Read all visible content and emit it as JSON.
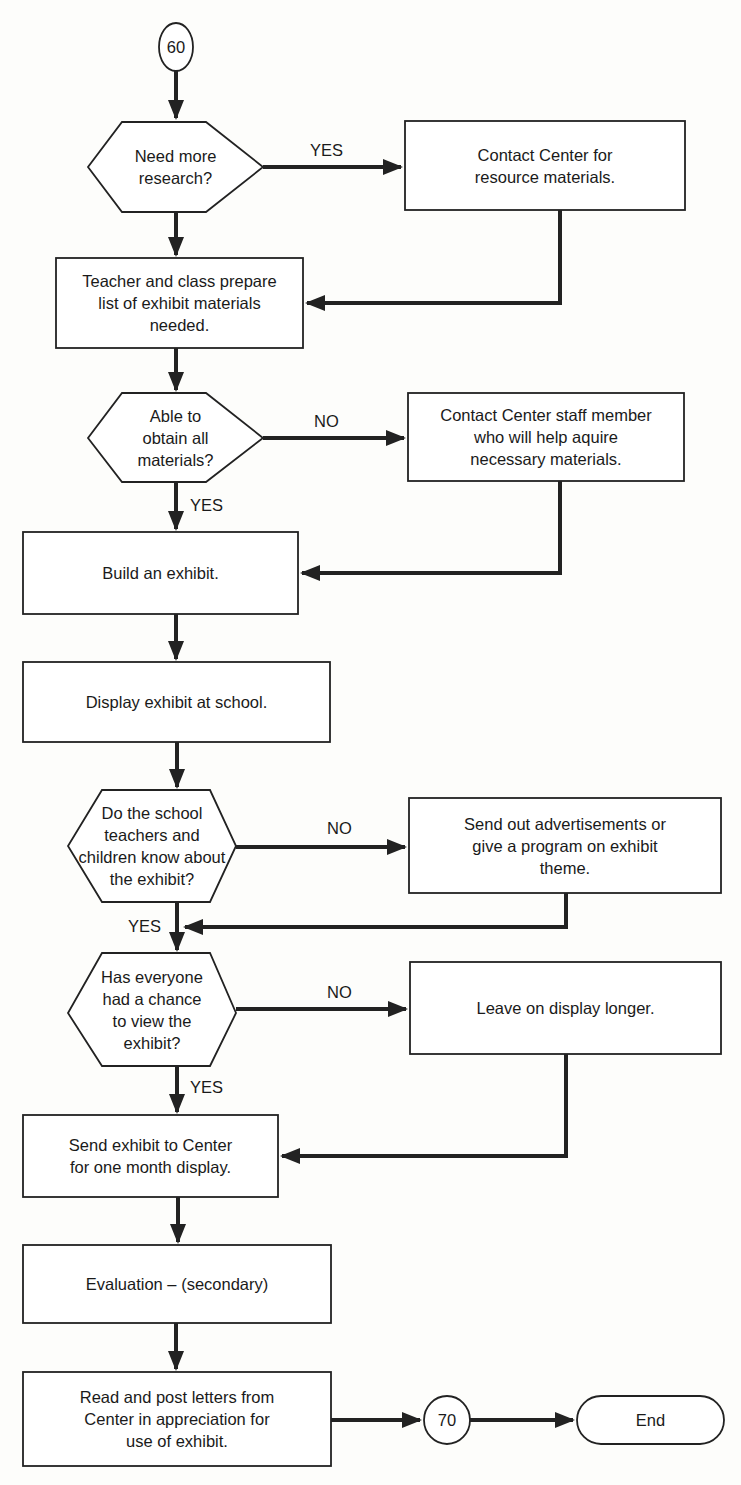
{
  "diagram": {
    "type": "flowchart",
    "nodes": {
      "c60": {
        "shape": "connector",
        "label": "60"
      },
      "d1": {
        "shape": "decision",
        "label": "Need more\nresearch?"
      },
      "p1": {
        "shape": "process",
        "label": "Contact Center for\nresource materials."
      },
      "p2": {
        "shape": "process",
        "label": "Teacher and class prepare\nlist of exhibit materials\nneeded."
      },
      "d2": {
        "shape": "decision",
        "label": "Able to\nobtain all\nmaterials?"
      },
      "p3": {
        "shape": "process",
        "label": "Contact Center staff member\nwho will help aquire\nnecessary materials."
      },
      "p4": {
        "shape": "process",
        "label": "Build an exhibit."
      },
      "p5": {
        "shape": "process",
        "label": "Display exhibit at school."
      },
      "d3": {
        "shape": "decision",
        "label": "Do the school\nteachers and\nchildren know about\nthe exhibit?"
      },
      "p6": {
        "shape": "process",
        "label": "Send out advertisements or\ngive a program on exhibit\ntheme."
      },
      "d4": {
        "shape": "decision",
        "label": "Has everyone\nhad a chance\nto view the\nexhibit?"
      },
      "p7": {
        "shape": "process",
        "label": "Leave on display longer."
      },
      "p8": {
        "shape": "process",
        "label": "Send exhibit to Center\nfor one month display."
      },
      "p9": {
        "shape": "process",
        "label": "Evaluation – (secondary)"
      },
      "p10": {
        "shape": "process",
        "label": "Read and post letters from\nCenter in appreciation for\nuse of exhibit."
      },
      "c70": {
        "shape": "connector",
        "label": "70"
      },
      "end": {
        "shape": "terminator",
        "label": "End"
      }
    },
    "edge_labels": {
      "d1_yes": "YES",
      "d2_no": "NO",
      "d2_yes": "YES",
      "d3_no": "NO",
      "d3_yes": "YES",
      "d4_no": "NO",
      "d4_yes": "YES"
    },
    "edges": [
      {
        "from": "c60",
        "to": "d1"
      },
      {
        "from": "d1",
        "to": "p1",
        "label": "YES"
      },
      {
        "from": "d1",
        "to": "p2"
      },
      {
        "from": "p1",
        "to": "p2"
      },
      {
        "from": "p2",
        "to": "d2"
      },
      {
        "from": "d2",
        "to": "p3",
        "label": "NO"
      },
      {
        "from": "d2",
        "to": "p4",
        "label": "YES"
      },
      {
        "from": "p3",
        "to": "p4"
      },
      {
        "from": "p4",
        "to": "p5"
      },
      {
        "from": "p5",
        "to": "d3"
      },
      {
        "from": "d3",
        "to": "p6",
        "label": "NO"
      },
      {
        "from": "d3",
        "to": "d4",
        "label": "YES"
      },
      {
        "from": "p6",
        "to": "d4"
      },
      {
        "from": "d4",
        "to": "p7",
        "label": "NO"
      },
      {
        "from": "d4",
        "to": "p8",
        "label": "YES"
      },
      {
        "from": "p7",
        "to": "p8"
      },
      {
        "from": "p8",
        "to": "p9"
      },
      {
        "from": "p9",
        "to": "p10"
      },
      {
        "from": "p10",
        "to": "c70"
      },
      {
        "from": "c70",
        "to": "end"
      }
    ]
  }
}
